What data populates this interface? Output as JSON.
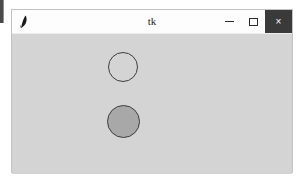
{
  "window": {
    "title": "tk",
    "icon": "feather-quill-icon",
    "background_color": "#d4d4d4",
    "titlebar_color": "#fdfdfd",
    "controls": {
      "minimize_label": "–",
      "maximize_label": "□",
      "close_label": "×",
      "close_background_color": "#3a3a3a",
      "close_glyph_color": "#ffffff"
    }
  },
  "canvas": {
    "background_color": "#d4d4d4",
    "shapes": [
      {
        "name": "circle-top",
        "kind": "circle",
        "fill": "none",
        "outline_color": "#3d3d3d",
        "center_x": 111,
        "center_y": 33,
        "radius": 15
      },
      {
        "name": "circle-bottom",
        "kind": "circle",
        "fill": "#a8a8a8",
        "outline_color": "#3d3d3d",
        "center_x": 111,
        "center_y": 87,
        "radius": 16
      }
    ]
  },
  "desktop": {
    "background_color": "#ffffff",
    "left_edge_sliver_color": "#4a4a4a"
  }
}
